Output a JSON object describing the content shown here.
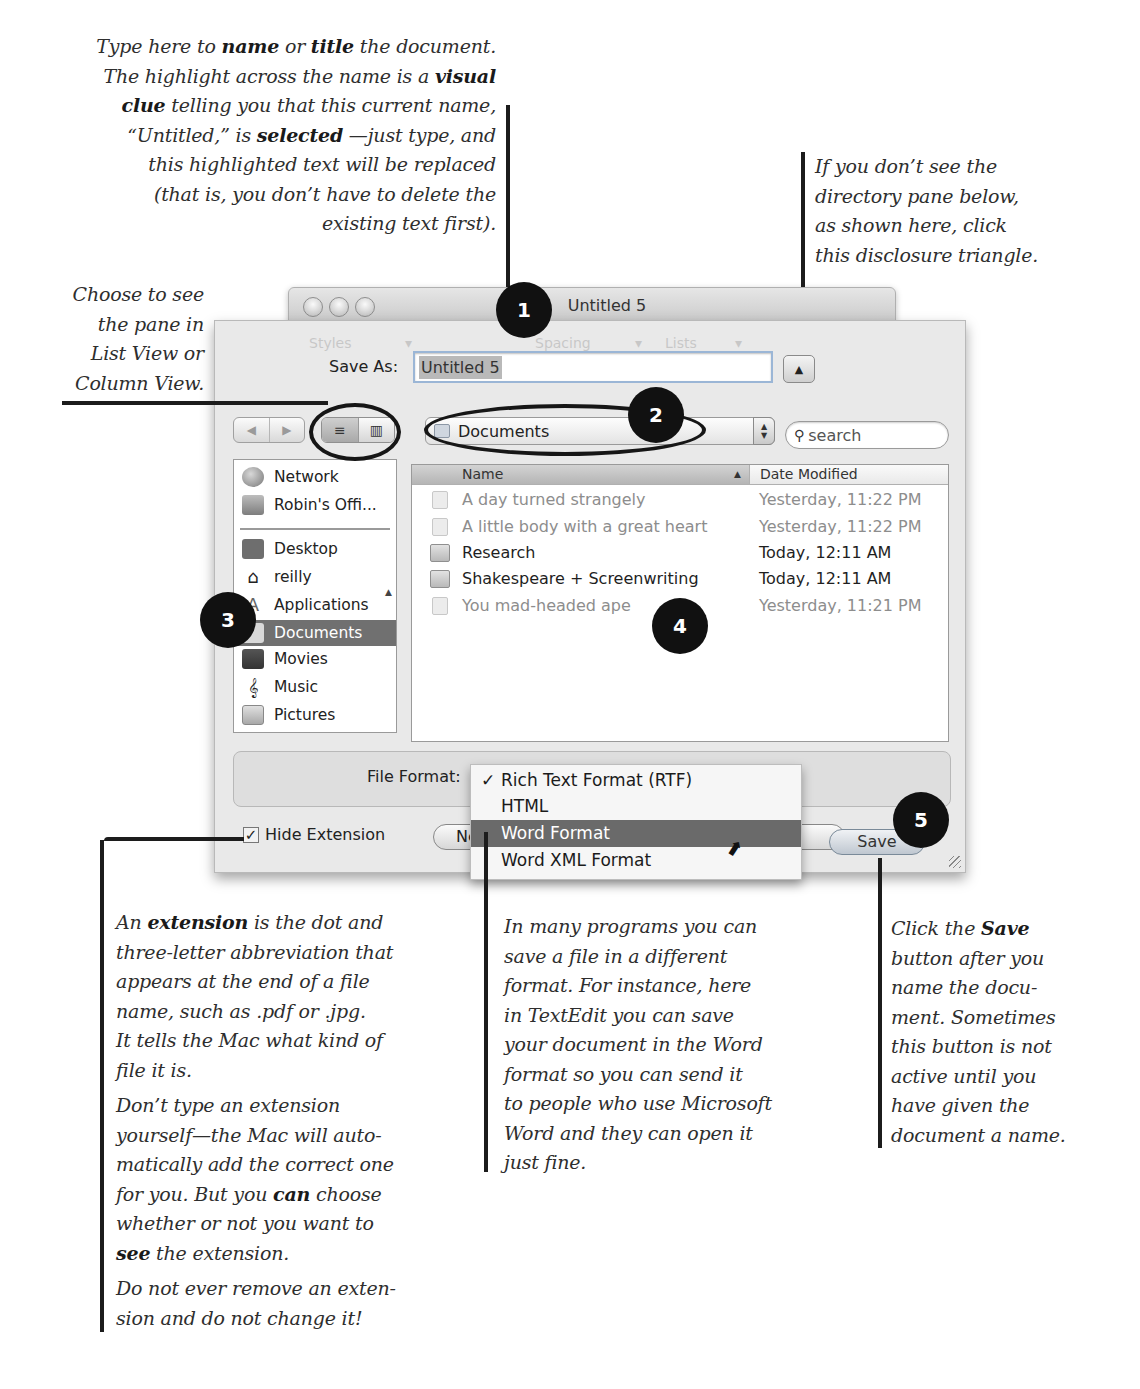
{
  "callouts": {
    "name_title": {
      "l1a": "Type here to ",
      "l1b": "name",
      "l1c": " or ",
      "l1d": "title",
      "l1e": " the document.",
      "l2a": "The highlight across the name is a ",
      "l2b": "visual",
      "l3a": "clue",
      "l3b": " telling you that this current name,",
      "l4a": "“Untitled,” is ",
      "l4b": "selected",
      "l4c": " —just type, and",
      "l5": "this highlighted text will be replaced",
      "l6": "(that is, you don’t have to delete the",
      "l7": "existing text first)."
    },
    "disclosure": {
      "l1": "If you don’t see the",
      "l2": "directory pane below,",
      "l3": "as shown here, click",
      "l4": "this disclosure triangle."
    },
    "view": {
      "l1": "Choose to see",
      "l2": "the pane in",
      "l3": "List View or",
      "l4": "Column View."
    },
    "extension": {
      "p1a": "An ",
      "p1b": "extension",
      "p1c": " is the dot and",
      "p1d": "three-letter abbreviation that",
      "p1e": "appears at the end of a file",
      "p1f": "name, such as .pdf or .jpg.",
      "p1g": "It tells the Mac what kind of",
      "p1h": "file it is.",
      "p2a": "Don’t type an extension",
      "p2b": "yourself—the Mac will auto-",
      "p2c": "matically add the correct one",
      "p2d": "for you. But you ",
      "p2e": "can",
      "p2f": " choose",
      "p2g": "whether or not you want to",
      "p2h": "see",
      "p2i": " the extension.",
      "p3a": "Do not ever remove an exten-",
      "p3b": "sion and do not change it!"
    },
    "format": {
      "l1": "In many programs you can",
      "l2": "save a file in a different",
      "l3": "format. For instance, here",
      "l4": "in TextEdit you can save",
      "l5": "your document in the Word",
      "l6": "format so you can send it",
      "l7": "to people who use Microsoft",
      "l8": "Word and they can open it",
      "l9": "just fine."
    },
    "save": {
      "l1a": "Click the ",
      "l1b": "Save",
      "l2": "button after you",
      "l3": "name the docu-",
      "l4": "ment. Sometimes",
      "l5": "this button is not",
      "l6": "active until you",
      "l7": "have given the",
      "l8": "document a name."
    }
  },
  "badges": [
    "1",
    "2",
    "3",
    "4",
    "5"
  ],
  "window": {
    "title": "Untitled 5",
    "ghost_toolbar": [
      "Styles",
      "▾",
      "Spacing",
      "▾",
      "Lists",
      "▾"
    ]
  },
  "save_dialog": {
    "save_as_label": "Save As:",
    "save_as_value": "Untitled 5",
    "disclosure_glyph": "▲",
    "nav_back": "◀",
    "nav_forward": "▶",
    "list_view_glyph": "≡",
    "column_view_glyph": "▥",
    "location": "Documents",
    "search_placeholder": "search",
    "sidebar": [
      {
        "label": "Network",
        "icon": "network-icon"
      },
      {
        "label": "Robin's Offi...",
        "icon": "disk-icon"
      },
      {
        "label": "Desktop",
        "icon": "desktop-icon"
      },
      {
        "label": "reilly",
        "icon": "home-icon"
      },
      {
        "label": "Applications",
        "icon": "applications-icon"
      },
      {
        "label": "Documents",
        "icon": "documents-icon",
        "selected": true
      },
      {
        "label": "Movies",
        "icon": "movies-icon"
      },
      {
        "label": "Music",
        "icon": "music-icon"
      },
      {
        "label": "Pictures",
        "icon": "pictures-icon"
      }
    ],
    "columns": {
      "name": "Name",
      "date": "Date Modified"
    },
    "files": [
      {
        "name": "A day turned strangely",
        "date": "Yesterday, 11:22 PM",
        "kind": "document",
        "enabled": false
      },
      {
        "name": "A little body with a great heart",
        "date": "Yesterday, 11:22 PM",
        "kind": "document",
        "enabled": false
      },
      {
        "name": "Research",
        "date": "Today, 12:11 AM",
        "kind": "folder",
        "enabled": true
      },
      {
        "name": "Shakespeare + Screenwriting",
        "date": "Today, 12:11 AM",
        "kind": "folder",
        "enabled": true
      },
      {
        "name": "You mad-headed ape",
        "date": "Yesterday, 11:21 PM",
        "kind": "document",
        "enabled": false
      }
    ],
    "file_format_label": "File Format:",
    "file_format_options": [
      {
        "label": "Rich Text Format (RTF)",
        "checked": true
      },
      {
        "label": "HTML"
      },
      {
        "label": "Word Format",
        "highlighted": true
      },
      {
        "label": "Word XML Format"
      }
    ],
    "checkmark": "✓",
    "hide_extension_label": "Hide Extension",
    "hide_extension_checked": true,
    "new_folder_partial": "Ne",
    "save_button": "Save"
  }
}
